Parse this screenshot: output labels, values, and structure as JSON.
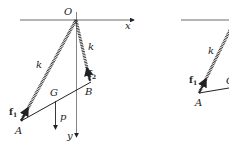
{
  "figure": {
    "left_diagram": {
      "origin_label": "O",
      "x_axis_label": "x",
      "y_axis_label": "y",
      "spring_left_label": "k",
      "spring_right_label": "k",
      "point_a_label": "A",
      "point_b_label": "B",
      "center_label": "G",
      "weight_label": "p",
      "force1_label": "f",
      "force1_sub": "1",
      "force2_label": "f",
      "force2_sub": "2"
    },
    "right_diagram": {
      "spring_label": "k",
      "point_a_label": "A",
      "force1_label": "f",
      "force1_sub": "1",
      "partial_label": "G"
    }
  },
  "colors": {
    "line": "#222222",
    "axis": "#555555"
  }
}
